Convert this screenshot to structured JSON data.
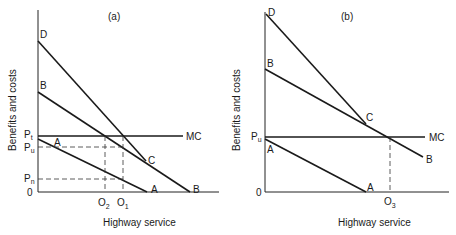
{
  "panels": [
    {
      "id": "a",
      "title": "(a)",
      "x_axis_label": "Highway service",
      "y_axis_label": "Benefits and costs",
      "origin_label": "0",
      "curves": {
        "D": "D",
        "B_top": "B",
        "B_end": "B",
        "A_top": "A",
        "A_end": "A",
        "C": "C",
        "MC": "MC"
      },
      "y_ticks": {
        "Pt": "P",
        "Pt_sub": "t",
        "Pu": "P",
        "Pu_sub": "u",
        "Pn": "P",
        "Pn_sub": "n"
      },
      "x_ticks": {
        "O2": "O",
        "O2_sub": "2",
        "O1": "O",
        "O1_sub": "1"
      }
    },
    {
      "id": "b",
      "title": "(b)",
      "x_axis_label": "Highway service",
      "y_axis_label": "Benefits and costs",
      "origin_label": "0",
      "curves": {
        "D": "D",
        "B_top": "B",
        "B_end": "B",
        "A_top": "A",
        "A_end": "A",
        "C": "C",
        "MC": "MC"
      },
      "y_ticks": {
        "Pu": "P",
        "Pu_sub": "u"
      },
      "x_ticks": {
        "O3": "O",
        "O3_sub": "3"
      }
    }
  ],
  "colors": {
    "line": "#1a1a1a",
    "background": "#ffffff"
  }
}
